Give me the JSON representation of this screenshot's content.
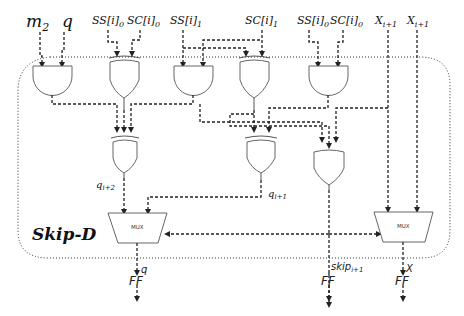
{
  "title": "Skip-D",
  "inputs": {
    "m2": "m",
    "m2_sub": "2",
    "q": "q",
    "ss0_a": "SS[i]",
    "ss0_a_sub": "0",
    "sc0_a": "SC[i]",
    "sc0_a_sub": "0",
    "ss1": "SS[i]",
    "ss1_sub": "1",
    "sc1": "SC[i]",
    "sc1_sub": "1",
    "ss0_b": "SS[i]",
    "ss0_b_sub": "0",
    "sc0_b": "SC[i]",
    "sc0_b_sub": "0",
    "x1": "X",
    "x1_sub": "i+1",
    "x2": "X",
    "x2_sub": "i+1"
  },
  "signals": {
    "q_i2": "q",
    "q_i2_sub": "i+2",
    "q_i1": "q",
    "q_i1_sub": "i+1",
    "skip": "skip",
    "skip_sub": "i+1"
  },
  "gates": [
    {
      "id": "and1",
      "type": "AND",
      "inputs": [
        "m2",
        "q"
      ]
    },
    {
      "id": "xor1",
      "type": "XOR",
      "inputs": [
        "SS[i]0",
        "SC[i]0"
      ]
    },
    {
      "id": "and2",
      "type": "AND",
      "inputs": [
        "SS[i]1",
        "SC[i]1"
      ]
    },
    {
      "id": "xor2",
      "type": "XOR",
      "inputs": [
        "SS[i]1",
        "SC[i]1"
      ]
    },
    {
      "id": "and3",
      "type": "AND",
      "inputs": [
        "SS[i]0",
        "SC[i]0"
      ]
    },
    {
      "id": "xor3",
      "type": "XOR",
      "inputs": [
        "and1",
        "xor1",
        "and2"
      ]
    },
    {
      "id": "xor4",
      "type": "XOR",
      "inputs": [
        "xor2",
        "and3"
      ]
    },
    {
      "id": "or1",
      "type": "OR",
      "inputs": [
        "and2",
        "xor2",
        "and3"
      ]
    }
  ],
  "muxes": [
    {
      "id": "mux_q",
      "label": "MUX"
    },
    {
      "id": "mux_x",
      "label": "MUX"
    }
  ],
  "flipflops": [
    {
      "id": "ff_q",
      "label": "FF",
      "output": "q"
    },
    {
      "id": "ff_skip",
      "label": "FF",
      "output": "skip"
    },
    {
      "id": "ff_x",
      "label": "FF",
      "output": "X"
    }
  ]
}
